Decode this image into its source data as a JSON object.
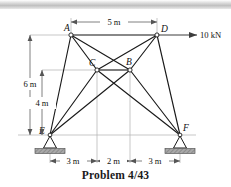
{
  "figure": {
    "caption": "Problem 4/43",
    "type": "statics-truss-diagram"
  },
  "joints": [
    {
      "id": "A",
      "label": "A",
      "x": 71,
      "y": 35
    },
    {
      "id": "D",
      "label": "D",
      "x": 157,
      "y": 35
    },
    {
      "id": "C",
      "label": "C",
      "x": 97,
      "y": 70
    },
    {
      "id": "B",
      "label": "B",
      "x": 130,
      "y": 70
    },
    {
      "id": "E",
      "label": "E",
      "x": 50,
      "y": 135
    },
    {
      "id": "F",
      "label": "F",
      "x": 180,
      "y": 135
    }
  ],
  "members": [
    {
      "from": "A",
      "to": "D"
    },
    {
      "from": "A",
      "to": "E"
    },
    {
      "from": "A",
      "to": "C"
    },
    {
      "from": "A",
      "to": "B"
    },
    {
      "from": "D",
      "to": "C"
    },
    {
      "from": "D",
      "to": "B"
    },
    {
      "from": "D",
      "to": "F"
    },
    {
      "from": "C",
      "to": "B"
    },
    {
      "from": "C",
      "to": "E"
    },
    {
      "from": "C",
      "to": "F"
    },
    {
      "from": "B",
      "to": "E"
    },
    {
      "from": "B",
      "to": "F"
    }
  ],
  "load": {
    "label": "10 kN",
    "magnitude": 10,
    "unit": "kN",
    "direction": "horizontal-right",
    "applied_at": "D"
  },
  "dimensions": {
    "top": {
      "label": "5 m",
      "value": 5,
      "unit": "m",
      "between": [
        "A",
        "D"
      ]
    },
    "vertical_outer": {
      "label": "6 m",
      "value": 6,
      "unit": "m",
      "between": [
        "A",
        "E"
      ]
    },
    "vertical_inner": {
      "label": "4 m",
      "value": 4,
      "unit": "m",
      "between": [
        "C",
        "E"
      ]
    },
    "bottom": [
      {
        "label": "3 m",
        "value": 3,
        "unit": "m"
      },
      {
        "label": "2 m",
        "value": 2,
        "unit": "m"
      },
      {
        "label": "3 m",
        "value": 3,
        "unit": "m"
      }
    ]
  },
  "supports": [
    {
      "at": "E",
      "kind": "pin-support"
    },
    {
      "at": "F",
      "kind": "pin-support"
    }
  ],
  "colors": {
    "member": "#1a1a1a",
    "dimension": "#555555",
    "extension": "#9a9a9a",
    "hatch": "#8c8c8c",
    "text": "#111111"
  }
}
